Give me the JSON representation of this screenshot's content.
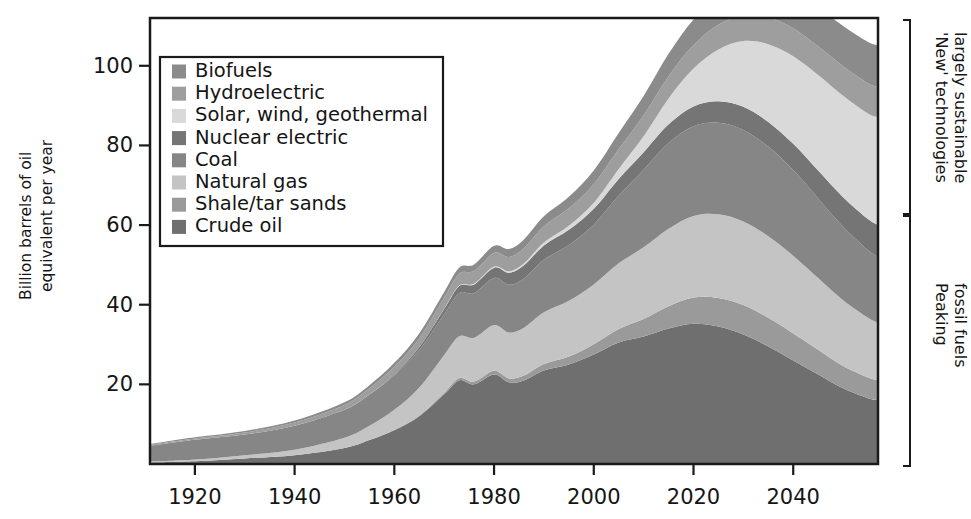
{
  "chart_data": {
    "type": "area",
    "title": "",
    "xlabel": "",
    "ylabel": "Billion barrels of oil equivalent per year",
    "ylabel_line1": "Billion barrels of oil",
    "ylabel_line2": "equivalent per year",
    "xlim": [
      1911,
      2057
    ],
    "ylim": [
      0,
      112
    ],
    "grid": false,
    "legend_position": "upper-left-inside",
    "xticks": [
      1920,
      1940,
      1960,
      1980,
      2000,
      2020,
      2040
    ],
    "xtick_labels": [
      "1920",
      "1940",
      "1960",
      "1980",
      "2000",
      "2020",
      "2040"
    ],
    "yticks": [
      20,
      40,
      60,
      80,
      100
    ],
    "ytick_labels": [
      "20",
      "40",
      "60",
      "80",
      "100"
    ],
    "x": [
      1911,
      1920,
      1930,
      1940,
      1950,
      1955,
      1960,
      1965,
      1970,
      1973,
      1976,
      1980,
      1983,
      1986,
      1990,
      1995,
      2000,
      2005,
      2010,
      2015,
      2020,
      2025,
      2030,
      2035,
      2040,
      2045,
      2050,
      2055,
      2057
    ],
    "stack_order_bottom_to_top": [
      "Crude oil",
      "Shale/tar sands",
      "Natural gas",
      "Coal",
      "Nuclear electric",
      "Solar, wind, geothermal",
      "Hydroelectric",
      "Biofuels"
    ],
    "series": [
      {
        "name": "Crude oil",
        "color": "#6f6f6f",
        "values": [
          0.4,
          0.7,
          1.4,
          2.2,
          4.0,
          6.0,
          8.5,
          12.0,
          17.5,
          21.0,
          20.0,
          22.5,
          20.5,
          21.0,
          23.5,
          25.0,
          27.5,
          30.5,
          32.0,
          34.0,
          35.2,
          34.5,
          32.5,
          29.5,
          26.0,
          22.5,
          19.0,
          16.5,
          16.0
        ]
      },
      {
        "name": "Shale/tar sands",
        "color": "#9a9a9a",
        "values": [
          0.0,
          0.0,
          0.0,
          0.0,
          0.0,
          0.0,
          0.1,
          0.2,
          0.4,
          0.6,
          0.7,
          0.9,
          1.0,
          1.2,
          1.6,
          2.0,
          2.6,
          3.4,
          4.4,
          5.6,
          6.6,
          7.2,
          7.4,
          7.2,
          6.8,
          6.2,
          5.6,
          5.2,
          5.0
        ]
      },
      {
        "name": "Natural gas",
        "color": "#c4c4c4",
        "values": [
          0.2,
          0.4,
          0.8,
          1.4,
          2.6,
          3.6,
          5.0,
          7.0,
          9.5,
          10.5,
          11.0,
          11.5,
          11.5,
          12.0,
          13.0,
          14.0,
          15.0,
          16.5,
          18.0,
          19.5,
          20.5,
          21.0,
          21.0,
          20.5,
          19.5,
          18.0,
          16.5,
          15.0,
          14.5
        ]
      },
      {
        "name": "Coal",
        "color": "#868686",
        "values": [
          4.0,
          5.0,
          5.2,
          6.0,
          7.0,
          7.8,
          8.6,
          9.4,
          10.2,
          10.8,
          11.2,
          11.8,
          12.0,
          12.4,
          13.2,
          14.0,
          15.0,
          17.0,
          19.5,
          21.5,
          22.5,
          23.0,
          23.0,
          22.5,
          21.5,
          20.0,
          18.5,
          17.0,
          16.5
        ]
      },
      {
        "name": "Nuclear electric",
        "color": "#757575",
        "values": [
          0.0,
          0.0,
          0.0,
          0.0,
          0.0,
          0.1,
          0.3,
          0.7,
          1.3,
          1.8,
          2.2,
          2.6,
          3.0,
          3.3,
          3.6,
          3.8,
          4.0,
          4.2,
          4.4,
          4.7,
          5.0,
          5.4,
          5.8,
          6.2,
          6.6,
          7.0,
          7.4,
          7.8,
          8.0
        ]
      },
      {
        "name": "Solar, wind, geothermal",
        "color": "#d9d9d9",
        "values": [
          0.0,
          0.0,
          0.0,
          0.0,
          0.0,
          0.0,
          0.0,
          0.0,
          0.1,
          0.1,
          0.2,
          0.3,
          0.4,
          0.5,
          0.7,
          1.0,
          1.5,
          2.5,
          4.0,
          6.5,
          9.5,
          13.0,
          16.5,
          19.5,
          22.0,
          24.0,
          25.5,
          26.5,
          27.0
        ]
      },
      {
        "name": "Hydroelectric",
        "color": "#9e9e9e",
        "values": [
          0.2,
          0.3,
          0.5,
          0.8,
          1.2,
          1.5,
          1.9,
          2.3,
          2.8,
          3.0,
          3.2,
          3.4,
          3.6,
          3.8,
          4.1,
          4.4,
          4.7,
          5.0,
          5.3,
          5.6,
          5.9,
          6.2,
          6.5,
          6.8,
          7.0,
          7.2,
          7.4,
          7.6,
          7.7
        ]
      },
      {
        "name": "Biofuels",
        "color": "#8b8b8b",
        "values": [
          0.2,
          0.3,
          0.4,
          0.5,
          0.7,
          0.8,
          1.0,
          1.2,
          1.4,
          1.5,
          1.6,
          1.8,
          2.0,
          2.2,
          2.5,
          2.9,
          3.4,
          4.0,
          4.8,
          5.6,
          6.4,
          7.2,
          8.0,
          8.6,
          9.2,
          9.7,
          10.1,
          10.4,
          10.5
        ]
      }
    ]
  },
  "legend": {
    "items": [
      {
        "label": "Biofuels",
        "color": "#8b8b8b"
      },
      {
        "label": "Hydroelectric",
        "color": "#9e9e9e"
      },
      {
        "label": "Solar, wind, geothermal",
        "color": "#d9d9d9"
      },
      {
        "label": "Nuclear electric",
        "color": "#757575"
      },
      {
        "label": "Coal",
        "color": "#868686"
      },
      {
        "label": "Natural gas",
        "color": "#c4c4c4"
      },
      {
        "label": "Shale/tar sands",
        "color": "#9a9a9a"
      },
      {
        "label": "Crude oil",
        "color": "#6f6f6f"
      }
    ]
  },
  "annotations": {
    "upper": {
      "line1": "'New' technologies",
      "line2": "largely sustainable"
    },
    "lower": {
      "line1": "Peaking",
      "line2": "fossil fuels"
    }
  }
}
